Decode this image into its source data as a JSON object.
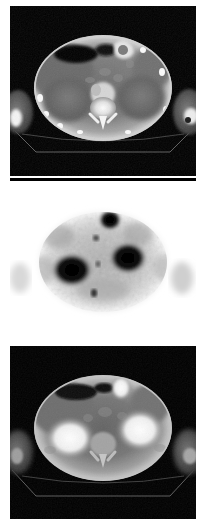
{
  "figure": {
    "modality_group": "PET-CT",
    "orientation": "axial",
    "body_region": "abdomen",
    "panel_count": 3,
    "layout": "vertical-stack",
    "background_color": "#ffffff",
    "width_px": 206,
    "height_px": 525
  },
  "panels": [
    {
      "index": 1,
      "name": "ct-panel",
      "label": "CT",
      "modality": "CT",
      "description": "Contrast-enhanced axial CT slice of the upper abdomen at the level of the kidneys",
      "colormap": "grayscale",
      "background_color": "#000000",
      "x": 10,
      "y": 6,
      "width": 186,
      "height": 170,
      "body_outline": {
        "center_x": 103,
        "center_y": 88,
        "radius_x": 68,
        "radius_y": 52,
        "wall_color": "#c8c8c8",
        "fat_color": "#8a8a8a",
        "soft_tissue_color": "#5a5a5a"
      },
      "features": [
        {
          "name": "spine-vertebral-body",
          "x": 103,
          "y": 104,
          "color": "#f2f2f2",
          "intensity": "very-bright"
        },
        {
          "name": "aorta-contrast",
          "x": 103,
          "y": 92,
          "color": "#d8d8d8",
          "intensity": "bright"
        },
        {
          "name": "kidney-right",
          "x": 72,
          "y": 98,
          "color": "#6e6e6e",
          "intensity": "mid"
        },
        {
          "name": "kidney-left",
          "x": 134,
          "y": 98,
          "color": "#6e6e6e",
          "intensity": "mid"
        },
        {
          "name": "liver",
          "x": 66,
          "y": 70,
          "color": "#6a6a6a",
          "intensity": "mid"
        },
        {
          "name": "bowel-gas-pocket",
          "x": 78,
          "y": 56,
          "color": "#0a0a0a",
          "intensity": "dark"
        },
        {
          "name": "stomach-contrast",
          "x": 113,
          "y": 52,
          "color": "#e0e0e0",
          "intensity": "bright"
        },
        {
          "name": "arm-left",
          "x": 17,
          "y": 112,
          "color": "#707070",
          "intensity": "mid"
        },
        {
          "name": "arm-right",
          "x": 189,
          "y": 112,
          "color": "#707070",
          "intensity": "mid"
        },
        {
          "name": "scanner-couch",
          "x": 103,
          "y": 150,
          "color": "#9a9a9a",
          "intensity": "thin-line"
        }
      ]
    },
    {
      "index": 2,
      "name": "pet-panel",
      "label": "PET",
      "modality": "PET",
      "description": "Axial FDG PET slice displayed with inverted grayscale: white background, dark regions indicate high tracer uptake",
      "colormap": "inverted-grayscale",
      "background_color": "#ffffff",
      "x": 10,
      "y": 178,
      "width": 186,
      "height": 166,
      "body_outline": {
        "center_x": 103,
        "center_y": 262,
        "radius_x": 62,
        "radius_y": 48,
        "soft_tissue_color": "#b9b9b9"
      },
      "hotspots": [
        {
          "name": "uptake-focus-right-renal",
          "x": 72,
          "y": 270,
          "radius_x": 21,
          "radius_y": 17,
          "intensity": "intense",
          "color": "#050505"
        },
        {
          "name": "uptake-focus-left-renal",
          "x": 128,
          "y": 258,
          "radius_x": 19,
          "radius_y": 16,
          "intensity": "intense",
          "color": "#050505"
        },
        {
          "name": "uptake-focus-upper-midline",
          "x": 110,
          "y": 220,
          "radius_x": 11,
          "radius_y": 10,
          "intensity": "intense",
          "color": "#070707"
        },
        {
          "name": "uptake-focus-small-midline",
          "x": 94,
          "y": 293,
          "radius_x": 3,
          "radius_y": 4,
          "intensity": "moderate",
          "color": "#303030"
        }
      ],
      "top_strip_color": "#000000",
      "top_strip_height": 3
    },
    {
      "index": 3,
      "name": "fused-pet-ct-panel",
      "label": "Fused PET/CT",
      "modality": "PET/CT fusion",
      "description": "Fused axial PET and CT image; bright white regions correspond to the intense uptake foci seen on PET",
      "colormap": "grayscale",
      "background_color": "#000000",
      "x": 10,
      "y": 346,
      "width": 186,
      "height": 173,
      "body_outline": {
        "center_x": 103,
        "center_y": 428,
        "radius_x": 68,
        "radius_y": 52,
        "wall_color": "#b4b4b4",
        "soft_tissue_color": "#5e5e5e"
      },
      "features": [
        {
          "name": "fused-uptake-right",
          "x": 72,
          "y": 436,
          "color": "#f0f0f0",
          "intensity": "very-bright"
        },
        {
          "name": "fused-uptake-left",
          "x": 133,
          "y": 428,
          "color": "#f0f0f0",
          "intensity": "very-bright"
        },
        {
          "name": "fused-uptake-upper-midline",
          "x": 114,
          "y": 390,
          "color": "#e8e8e8",
          "intensity": "bright"
        },
        {
          "name": "spine-vertebral-body",
          "x": 103,
          "y": 444,
          "color": "#9e9e9e",
          "intensity": "mid-bright"
        },
        {
          "name": "bowel-gas-pocket",
          "x": 80,
          "y": 396,
          "color": "#0c0c0c",
          "intensity": "dark"
        },
        {
          "name": "arm-left",
          "x": 17,
          "y": 452,
          "color": "#6a6a6a",
          "intensity": "mid"
        },
        {
          "name": "arm-right",
          "x": 189,
          "y": 452,
          "color": "#6a6a6a",
          "intensity": "mid"
        },
        {
          "name": "scanner-couch",
          "x": 103,
          "y": 492,
          "color": "#8e8e8e",
          "intensity": "thin-line"
        }
      ]
    }
  ],
  "margins": {
    "left_px": 10,
    "right_px": 10,
    "top_px": 6,
    "bottom_px": 6,
    "between_panels_px": 2,
    "color": "#ffffff"
  }
}
